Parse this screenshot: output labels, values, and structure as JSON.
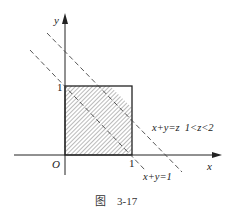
{
  "figure": {
    "axes": {
      "x_label": "x",
      "y_label": "y",
      "origin_label": "O",
      "x_tick": "1",
      "y_tick": "1"
    },
    "lines": {
      "line1_label": "x+y=1",
      "line2_label": "x+y=z  1<z<2"
    },
    "caption": "图    3-17",
    "colors": {
      "stroke": "#222222",
      "hatch": "#555555"
    }
  }
}
